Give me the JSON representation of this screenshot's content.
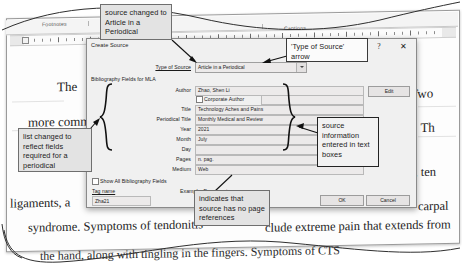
{
  "app": {
    "ribbon_groups": [
      "Footnotes",
      "Captions",
      "Index"
    ]
  },
  "document": {
    "lines": {
      "the": "The ",
      "two": ". Two",
      "more_common": "more common",
      "ss_th": "ss. Th",
      "es_ten": "es, ten",
      "ligaments": "ligaments, a",
      "carpal": "carpal",
      "syndrome": "syndrome. Symptoms of tendonitis",
      "include_extreme": "clude extreme pain that extends from",
      "last_line": "the hand, along with tingling in the fingers. Symptoms of CTS"
    }
  },
  "dialog": {
    "title": "Create Source",
    "help_icon": "?",
    "close_icon": "✕",
    "type_of_source_label": "Type of Source",
    "type_of_source_value": "Article in a Periodical",
    "bibliography_fields_label": "Bibliography Fields for MLA",
    "fields": [
      {
        "label": "Author",
        "value": "Zhao, Shen Li"
      },
      {
        "label": "Title",
        "value": "Technology Aches and Pains"
      },
      {
        "label": "Periodical Title",
        "value": "Monthly Medical and Review"
      },
      {
        "label": "Year",
        "value": "2021"
      },
      {
        "label": "Month",
        "value": "July"
      },
      {
        "label": "Day",
        "value": ""
      },
      {
        "label": "Pages",
        "value": "n. pag."
      },
      {
        "label": "Medium",
        "value": "Web"
      }
    ],
    "corporate_author_label": "Corporate Author",
    "corporate_author_value": "",
    "edit_button": "Edit",
    "show_all_label": "Show All Bibliography Fields",
    "tag_name_label": "Tag name",
    "tag_name_value": "Zha21",
    "example_label": "Example: Document",
    "ok_button": "OK",
    "cancel_button": "Cancel"
  },
  "annotations": {
    "source_changed": "source changed to Article in a Periodical",
    "type_of_source_arrow": "'Type of Source' arrow",
    "list_changed": "list changed to reflect fields required for a periodical",
    "source_information": "source information entered in text boxes",
    "no_page_refs": "indicates that source has no page references"
  }
}
